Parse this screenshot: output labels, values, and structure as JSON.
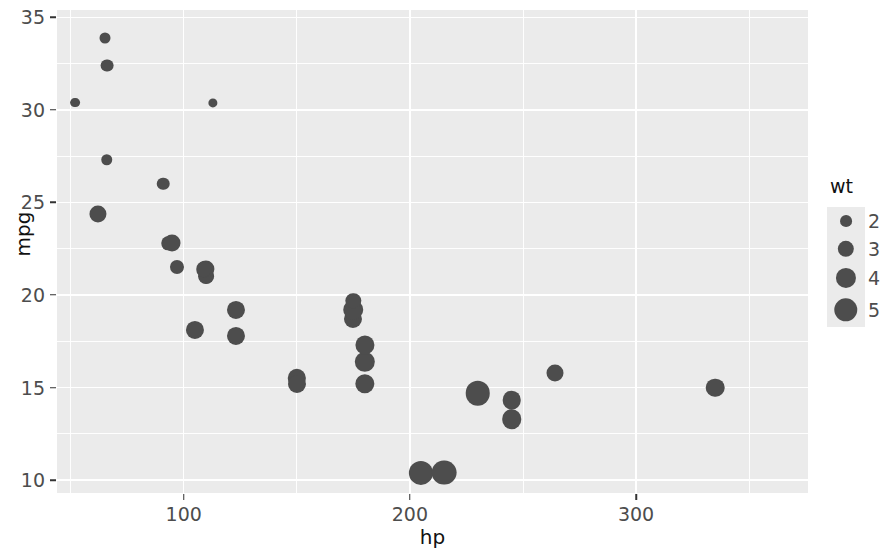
{
  "chart_data": {
    "type": "scatter",
    "title": "",
    "xlabel": "hp",
    "ylabel": "mpg",
    "xlim": [
      44,
      376
    ],
    "ylim": [
      9.3,
      35.4
    ],
    "x_ticks": [
      100,
      200,
      300
    ],
    "y_ticks": [
      10,
      15,
      20,
      25,
      30,
      35
    ],
    "x_minor_ticks": [
      50,
      150,
      250,
      350
    ],
    "y_minor_ticks": [
      12.5,
      17.5,
      22.5,
      27.5,
      32.5
    ],
    "grid": true,
    "size_legend": {
      "title": "wt",
      "breaks": [
        2,
        3,
        4,
        5
      ],
      "labels": [
        "2",
        "3",
        "4",
        "5"
      ],
      "position": "right"
    },
    "point_color": "#4d4d4d",
    "panel_background": "#ebebeb",
    "grid_color": "#ffffff",
    "size_variable": "wt",
    "points": [
      {
        "x": 110,
        "y": 21.0,
        "size": 2.62
      },
      {
        "x": 110,
        "y": 21.0,
        "size": 2.875
      },
      {
        "x": 93,
        "y": 22.8,
        "size": 2.32
      },
      {
        "x": 110,
        "y": 21.4,
        "size": 3.215
      },
      {
        "x": 175,
        "y": 18.7,
        "size": 3.44
      },
      {
        "x": 105,
        "y": 18.1,
        "size": 3.46
      },
      {
        "x": 245,
        "y": 14.3,
        "size": 3.57
      },
      {
        "x": 62,
        "y": 24.4,
        "size": 3.19
      },
      {
        "x": 95,
        "y": 22.8,
        "size": 3.15
      },
      {
        "x": 123,
        "y": 19.2,
        "size": 3.44
      },
      {
        "x": 123,
        "y": 17.8,
        "size": 3.44
      },
      {
        "x": 180,
        "y": 16.4,
        "size": 4.07
      },
      {
        "x": 180,
        "y": 17.3,
        "size": 3.73
      },
      {
        "x": 180,
        "y": 15.2,
        "size": 3.78
      },
      {
        "x": 205,
        "y": 10.4,
        "size": 5.25
      },
      {
        "x": 215,
        "y": 10.4,
        "size": 5.424
      },
      {
        "x": 230,
        "y": 14.7,
        "size": 5.345
      },
      {
        "x": 66,
        "y": 32.4,
        "size": 2.2
      },
      {
        "x": 52,
        "y": 30.4,
        "size": 1.615
      },
      {
        "x": 65,
        "y": 33.9,
        "size": 1.835
      },
      {
        "x": 97,
        "y": 21.5,
        "size": 2.465
      },
      {
        "x": 150,
        "y": 15.5,
        "size": 3.52
      },
      {
        "x": 150,
        "y": 15.2,
        "size": 3.435
      },
      {
        "x": 245,
        "y": 13.3,
        "size": 3.84
      },
      {
        "x": 175,
        "y": 19.2,
        "size": 3.845
      },
      {
        "x": 66,
        "y": 27.3,
        "size": 1.935
      },
      {
        "x": 91,
        "y": 26.0,
        "size": 2.14
      },
      {
        "x": 113,
        "y": 30.4,
        "size": 1.513
      },
      {
        "x": 264,
        "y": 15.8,
        "size": 3.17
      },
      {
        "x": 175,
        "y": 19.7,
        "size": 2.77
      },
      {
        "x": 335,
        "y": 15.0,
        "size": 3.57
      },
      {
        "x": 109,
        "y": 21.4,
        "size": 2.78
      }
    ]
  }
}
